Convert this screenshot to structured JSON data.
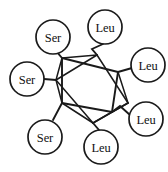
{
  "diagram": {
    "type": "chemical-structure",
    "core_name": "cubane",
    "line_color": "#1a1a1a",
    "background_color": "#ffffff",
    "nodes": [
      {
        "id": "ser-top-left",
        "label": "Ser",
        "cx": 53,
        "cy": 37,
        "r": 17
      },
      {
        "id": "leu-top",
        "label": "Leu",
        "cx": 105,
        "cy": 27,
        "r": 17
      },
      {
        "id": "leu-upper-right",
        "label": "Leu",
        "cx": 148,
        "cy": 65,
        "r": 17
      },
      {
        "id": "ser-left",
        "label": "Ser",
        "cx": 27,
        "cy": 79,
        "r": 17
      },
      {
        "id": "leu-lower-right",
        "label": "Leu",
        "cx": 146,
        "cy": 119,
        "r": 17
      },
      {
        "id": "ser-bottom-left",
        "label": "Ser",
        "cx": 45,
        "cy": 137,
        "r": 17
      },
      {
        "id": "leu-bottom",
        "label": "Leu",
        "cx": 101,
        "cy": 147,
        "r": 17
      }
    ],
    "core_vertices": [
      {
        "id": "v-front-top-left",
        "x": 62,
        "y": 58
      },
      {
        "id": "v-front-bottom-left",
        "x": 62,
        "y": 103
      },
      {
        "id": "v-front-top-right",
        "x": 118,
        "y": 72
      },
      {
        "id": "v-front-bottom-right",
        "x": 112,
        "y": 112
      },
      {
        "id": "v-back-left",
        "x": 56,
        "y": 80
      },
      {
        "id": "v-back-top",
        "x": 97,
        "y": 55
      },
      {
        "id": "v-back-bottom",
        "x": 93,
        "y": 123
      },
      {
        "id": "v-back-right",
        "x": 128,
        "y": 103
      }
    ],
    "substituent_counts": {
      "Ser": 3,
      "Leu": 4,
      "total": 7
    }
  }
}
